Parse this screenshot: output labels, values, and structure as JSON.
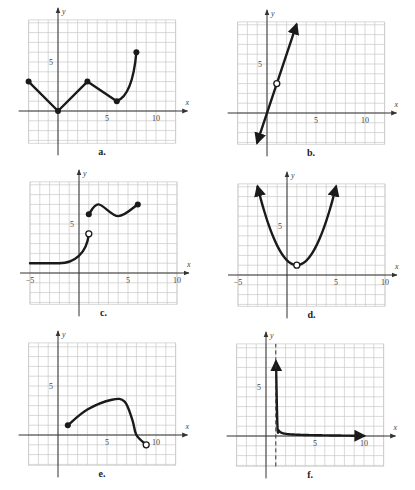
{
  "figure": {
    "cell_px": 9.8,
    "graphs": [
      {
        "id": "a",
        "label": "a.",
        "origin": [
          58,
          111
        ],
        "xrange": [
          -3,
          12
        ],
        "yrange": [
          -3.3,
          9.3
        ],
        "ticks": {
          "x": [
            {
              "v": 5,
              "t": "5"
            },
            {
              "v": 10,
              "t": "10"
            }
          ],
          "y": [
            {
              "v": 5,
              "t": "5"
            }
          ]
        },
        "x_axis_label": "x",
        "y_axis_label": "y"
      },
      {
        "id": "b",
        "label": "b.",
        "origin": [
          267,
          113
        ],
        "xrange": [
          -3,
          12
        ],
        "yrange": [
          -3.2,
          9.3
        ],
        "ticks": {
          "x": [
            {
              "v": 5,
              "t": "5"
            },
            {
              "v": 10,
              "t": "10"
            }
          ],
          "y": [
            {
              "v": 5,
              "t": "5"
            }
          ]
        },
        "x_axis_label": "x",
        "y_axis_label": "y"
      },
      {
        "id": "c",
        "label": "c.",
        "origin": [
          79,
          273
        ],
        "xrange": [
          -5,
          10
        ],
        "yrange": [
          -3.2,
          9.3
        ],
        "ticks": {
          "x": [
            {
              "v": -5,
              "t": "−5"
            },
            {
              "v": 5,
              "t": "5"
            },
            {
              "v": 10,
              "t": "10"
            }
          ],
          "y": [
            {
              "v": 5,
              "t": "5"
            }
          ]
        },
        "x_axis_label": "x",
        "y_axis_label": "y"
      },
      {
        "id": "d",
        "label": "d.",
        "origin": [
          287,
          275
        ],
        "xrange": [
          -5,
          10
        ],
        "yrange": [
          -3.2,
          9.3
        ],
        "ticks": {
          "x": [
            {
              "v": -5,
              "t": "−5"
            },
            {
              "v": 5,
              "t": "5"
            },
            {
              "v": 10,
              "t": "10"
            }
          ],
          "y": [
            {
              "v": 5,
              "t": "5"
            }
          ]
        },
        "x_axis_label": "x",
        "y_axis_label": "y"
      },
      {
        "id": "e",
        "label": "e.",
        "origin": [
          58,
          435
        ],
        "xrange": [
          -3,
          12
        ],
        "yrange": [
          -3.1,
          9.4
        ],
        "ticks": {
          "x": [
            {
              "v": 5,
              "t": "5"
            },
            {
              "v": 10,
              "t": "10"
            }
          ],
          "y": [
            {
              "v": 5,
              "t": "5"
            }
          ]
        },
        "x_axis_label": "x",
        "y_axis_label": "y"
      },
      {
        "id": "f",
        "label": "f.",
        "origin": [
          266,
          436
        ],
        "xrange": [
          -3,
          12
        ],
        "yrange": [
          -3.1,
          9.4
        ],
        "ticks": {
          "x": [
            {
              "v": 5,
              "t": "5"
            },
            {
              "v": 10,
              "t": "10"
            }
          ],
          "y": [
            {
              "v": 5,
              "t": "5"
            }
          ]
        },
        "x_axis_label": "x",
        "y_axis_label": "y"
      }
    ]
  },
  "chart_data": [
    {
      "type": "line",
      "title": "a.",
      "xlabel": "x",
      "ylabel": "y",
      "grid": true,
      "series": [
        {
          "name": "piecewise",
          "points": [
            [
              -3,
              3
            ],
            [
              0,
              0
            ],
            [
              3,
              3
            ],
            [
              6,
              1
            ],
            [
              7,
              2.5
            ],
            [
              8,
              6
            ]
          ],
          "endpoints": {
            "filled": [
              [
                -3,
                3
              ],
              [
                0,
                0
              ],
              [
                3,
                3
              ],
              [
                6,
                1
              ],
              [
                8,
                6
              ]
            ],
            "open": []
          }
        }
      ],
      "xlim": [
        -3,
        12
      ],
      "ylim": [
        -3,
        9
      ]
    },
    {
      "type": "line",
      "title": "b.",
      "xlabel": "x",
      "ylabel": "y",
      "grid": true,
      "series": [
        {
          "name": "y = 3x",
          "points": [
            [
              -1,
              -3
            ],
            [
              3,
              9
            ]
          ],
          "arrows": "both",
          "endpoints": {
            "filled": [],
            "open": [
              [
                1,
                3
              ]
            ]
          }
        }
      ],
      "xlim": [
        -3,
        12
      ],
      "ylim": [
        -3,
        9
      ]
    },
    {
      "type": "line",
      "title": "c.",
      "xlabel": "x",
      "ylabel": "y",
      "grid": true,
      "series": [
        {
          "name": "left piece",
          "points": [
            [
              -5,
              1
            ],
            [
              -2,
              1
            ],
            [
              0,
              2
            ],
            [
              1,
              4
            ]
          ],
          "endpoints": {
            "filled": [],
            "open": [
              [
                1,
                4
              ]
            ]
          }
        },
        {
          "name": "right piece",
          "points": [
            [
              1,
              6
            ],
            [
              2,
              7
            ],
            [
              4,
              6
            ],
            [
              6,
              7
            ]
          ],
          "endpoints": {
            "filled": [
              [
                1,
                6
              ],
              [
                6,
                7
              ]
            ],
            "open": []
          }
        }
      ],
      "xlim": [
        -5,
        10
      ],
      "ylim": [
        -3,
        9
      ]
    },
    {
      "type": "line",
      "title": "d.",
      "xlabel": "x",
      "ylabel": "y",
      "grid": true,
      "series": [
        {
          "name": "parabola",
          "points": [
            [
              -3,
              9
            ],
            [
              1,
              1
            ],
            [
              5,
              9
            ]
          ],
          "arrows": "both",
          "endpoints": {
            "filled": [],
            "open": [
              [
                1,
                1
              ]
            ]
          }
        }
      ],
      "xlim": [
        -5,
        10
      ],
      "ylim": [
        -3,
        9
      ]
    },
    {
      "type": "line",
      "title": "e.",
      "xlabel": "x",
      "ylabel": "y",
      "grid": true,
      "series": [
        {
          "name": "curve",
          "points": [
            [
              1,
              1
            ],
            [
              3,
              2.6
            ],
            [
              6,
              3.6
            ],
            [
              7,
              3.3
            ],
            [
              8,
              0
            ],
            [
              9,
              -1
            ]
          ],
          "endpoints": {
            "filled": [
              [
                1,
                1
              ]
            ],
            "open": [
              [
                9,
                -1
              ]
            ]
          }
        }
      ],
      "xlim": [
        -3,
        12
      ],
      "ylim": [
        -3,
        9
      ]
    },
    {
      "type": "line",
      "title": "f.",
      "xlabel": "x",
      "ylabel": "y",
      "grid": true,
      "series": [
        {
          "name": "hyperbola",
          "points": [
            [
              1.1,
              9
            ],
            [
              1.5,
              2
            ],
            [
              2,
              0.7
            ],
            [
              5,
              0.3
            ],
            [
              10,
              0.1
            ]
          ],
          "arrows": "both",
          "asymptote": {
            "x": 1,
            "style": "dashed"
          }
        }
      ],
      "xlim": [
        -3,
        12
      ],
      "ylim": [
        -3,
        9
      ]
    }
  ]
}
